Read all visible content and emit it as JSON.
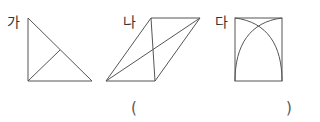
{
  "figures": [
    {
      "label": "가",
      "shape": "right-triangle",
      "extra": "segment from right-angle vertex to hypotenuse"
    },
    {
      "label": "나",
      "shape": "parallelogram",
      "extra": "two diagonals"
    },
    {
      "label": "다",
      "shape": "rectangle",
      "extra": "two intersecting arcs"
    }
  ],
  "answer": {
    "open": "(",
    "close": ")",
    "value": ""
  },
  "colors": {
    "stroke": "#555555",
    "text": "#333333"
  }
}
